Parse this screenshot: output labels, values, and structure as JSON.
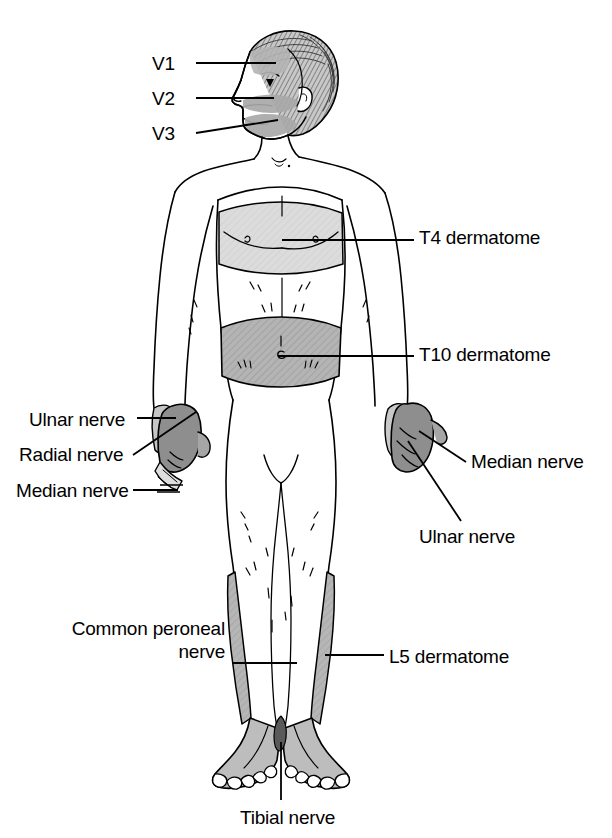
{
  "figure": {
    "view": "anterior full-body figure",
    "background_color": "#ffffff",
    "line_color": "#000000"
  },
  "shading": {
    "light_gray": "#d9d9d9",
    "medium_gray": "#b0b0b0",
    "dark_gray": "#8c8c8c",
    "hair_gray": "#9a9a9a"
  },
  "labels": {
    "v1": "V1",
    "v2": "V2",
    "v3": "V3",
    "t4_dermatome": "T4 dermatome",
    "t10_dermatome": "T10 dermatome",
    "ulnar_nerve_left": "Ulnar nerve",
    "radial_nerve_left": "Radial nerve",
    "median_nerve_left": "Median nerve",
    "median_nerve_right": "Median nerve",
    "ulnar_nerve_right": "Ulnar nerve",
    "common_peroneal_nerve": "Common peroneal\nnerve",
    "l5_dermatome": "L5 dermatome",
    "tibial_nerve": "Tibial nerve"
  },
  "regions": [
    {
      "id": "v1",
      "name": "V1 trigeminal division",
      "area": "forehead",
      "shade": "medium_gray"
    },
    {
      "id": "v2",
      "name": "V2 trigeminal division",
      "area": "midface / upper lip",
      "shade": "medium_gray"
    },
    {
      "id": "v3",
      "name": "V3 trigeminal division",
      "area": "mandible / jaw",
      "shade": "medium_gray"
    },
    {
      "id": "t4",
      "name": "T4 dermatome",
      "area": "chest band at nipple line",
      "shade": "light_gray"
    },
    {
      "id": "t10",
      "name": "T10 dermatome",
      "area": "abdominal band at umbilicus",
      "shade": "medium_gray"
    },
    {
      "id": "ulnar-left",
      "name": "Ulnar nerve territory",
      "area": "left hand ulnar side",
      "shade": "dark_gray"
    },
    {
      "id": "radial-left",
      "name": "Radial nerve territory",
      "area": "left hand dorsal radial side",
      "shade": "medium_gray"
    },
    {
      "id": "median-left",
      "name": "Median nerve territory",
      "area": "left hand digit tips",
      "shade": "light_gray"
    },
    {
      "id": "median-right",
      "name": "Median nerve territory",
      "area": "right hand digits",
      "shade": "dark_gray"
    },
    {
      "id": "ulnar-right",
      "name": "Ulnar nerve territory",
      "area": "right hand ulnar side",
      "shade": "medium_gray"
    },
    {
      "id": "l5-left",
      "name": "L5 dermatome",
      "area": "left lateral lower leg and foot dorsum",
      "shade": "medium_gray"
    },
    {
      "id": "l5-right",
      "name": "L5 dermatome",
      "area": "right lateral lower leg and foot dorsum",
      "shade": "medium_gray"
    },
    {
      "id": "tibial",
      "name": "Tibial nerve territory",
      "area": "medial ankle / sole",
      "shade": "dark_gray"
    }
  ]
}
